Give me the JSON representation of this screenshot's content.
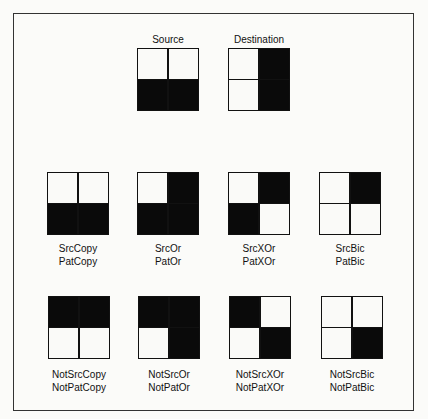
{
  "header": {
    "source_title": "Source",
    "destination_title": "Destination"
  },
  "patterns": {
    "source": [
      "white",
      "white",
      "black",
      "black"
    ],
    "destination": [
      "white",
      "black",
      "white",
      "black"
    ]
  },
  "row1": [
    {
      "line1": "SrcCopy",
      "line2": "PatCopy",
      "cells": [
        "white",
        "white",
        "black",
        "black"
      ]
    },
    {
      "line1": "SrcOr",
      "line2": "PatOr",
      "cells": [
        "white",
        "black",
        "black",
        "black"
      ]
    },
    {
      "line1": "SrcXOr",
      "line2": "PatXOr",
      "cells": [
        "white",
        "black",
        "black",
        "white"
      ]
    },
    {
      "line1": "SrcBic",
      "line2": "PatBic",
      "cells": [
        "white",
        "black",
        "white",
        "white"
      ]
    }
  ],
  "row2": [
    {
      "line1": "NotSrcCopy",
      "line2": "NotPatCopy",
      "cells": [
        "black",
        "black",
        "white",
        "white"
      ]
    },
    {
      "line1": "NotSrcOr",
      "line2": "NotPatOr",
      "cells": [
        "black",
        "black",
        "white",
        "black"
      ]
    },
    {
      "line1": "NotSrcXOr",
      "line2": "NotPatXOr",
      "cells": [
        "black",
        "white",
        "white",
        "black"
      ]
    },
    {
      "line1": "NotSrcBic",
      "line2": "NotPatBic",
      "cells": [
        "white",
        "white",
        "white",
        "black"
      ]
    }
  ]
}
